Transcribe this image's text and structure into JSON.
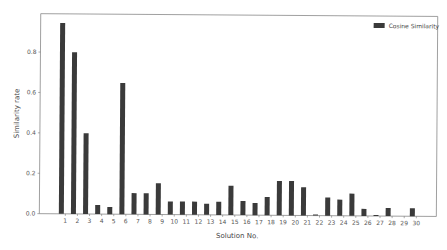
{
  "chart_data": {
    "type": "bar",
    "title": "",
    "xlabel": "Solution No.",
    "ylabel": "Similarity rate",
    "categories": [
      "1",
      "2",
      "3",
      "4",
      "5",
      "6",
      "7",
      "8",
      "9",
      "10",
      "11",
      "12",
      "13",
      "14",
      "15",
      "16",
      "17",
      "18",
      "19",
      "20",
      "21",
      "22",
      "23",
      "24",
      "25",
      "26",
      "27",
      "28",
      "29",
      "30"
    ],
    "series": [
      {
        "name": "Cosine Similarity",
        "color": "#3a3a3a",
        "values": [
          0.945,
          0.8,
          0.4,
          0.045,
          0.035,
          0.65,
          0.105,
          0.105,
          0.155,
          0.065,
          0.065,
          0.065,
          0.055,
          0.065,
          0.145,
          0.07,
          0.06,
          0.09,
          0.17,
          0.17,
          0.14,
          0.005,
          0.09,
          0.08,
          0.11,
          0.035,
          0.005,
          0.04,
          0.0,
          0.04
        ]
      }
    ],
    "yticks": [
      "0.0",
      "0.2",
      "0.4",
      "0.6",
      "0.8"
    ],
    "ytick_values": [
      0.0,
      0.2,
      0.4,
      0.6,
      0.8
    ],
    "ylim": [
      0,
      0.99
    ],
    "grid": false,
    "legend_position": "upper right"
  }
}
